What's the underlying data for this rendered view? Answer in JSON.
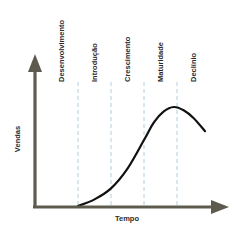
{
  "chart_data": {
    "type": "line",
    "title": "",
    "xlabel": "Tempo",
    "ylabel": "Vendas",
    "stages": [
      "Desenvolvimento",
      "Introdução",
      "Crescimento",
      "Maturidade",
      "Declínio"
    ],
    "x_range": [
      0,
      5
    ],
    "y_range": [
      0,
      1
    ],
    "series": [
      {
        "name": "Vendas",
        "x": [
          1.0,
          1.5,
          2.0,
          2.5,
          3.0,
          3.3,
          3.6,
          3.9,
          4.2,
          4.5,
          4.85
        ],
        "y": [
          0.0,
          0.06,
          0.16,
          0.34,
          0.6,
          0.76,
          0.86,
          0.9,
          0.87,
          0.8,
          0.68
        ]
      }
    ],
    "colors": {
      "axis": "#5e5a4e",
      "curve": "#111111",
      "divider": "#a9c8d8"
    },
    "grid": false,
    "legend": "none"
  }
}
